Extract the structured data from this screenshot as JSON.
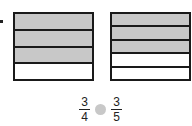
{
  "models": [
    {
      "id": "left",
      "rows": 4,
      "shaded": 3
    },
    {
      "id": "right",
      "rows": 5,
      "shaded": 3
    }
  ],
  "comparison": {
    "left": {
      "numerator": "3",
      "denominator": "4"
    },
    "right": {
      "numerator": "3",
      "denominator": "5"
    },
    "symbol": ""
  },
  "colors": {
    "shade": "#c8c8c8",
    "stroke": "#1a1a1a"
  }
}
